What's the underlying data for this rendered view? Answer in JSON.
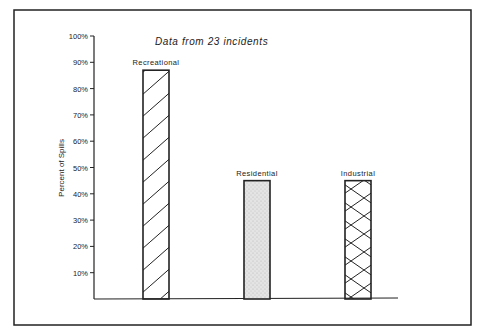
{
  "chart_data": {
    "type": "bar",
    "title": "Data from 23 incidents",
    "xlabel": "",
    "ylabel": "Percent of Spills",
    "ylim": [
      0,
      100
    ],
    "yticks": [
      "10%",
      "20%",
      "30%",
      "40%",
      "50%",
      "60%",
      "70%",
      "80%",
      "90%",
      "100%"
    ],
    "grid": false,
    "legend": "none",
    "categories": [
      "Recreational",
      "Residential",
      "Industrial"
    ],
    "values": [
      87,
      45,
      45
    ],
    "bar_patterns": [
      "diagonal-hatch",
      "stipple",
      "cross-hatch"
    ]
  }
}
